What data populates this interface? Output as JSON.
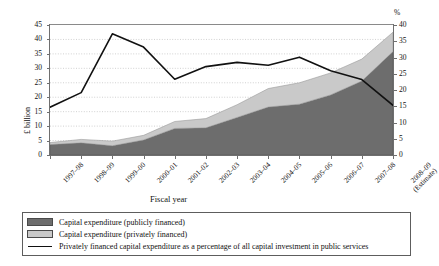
{
  "chart_data": {
    "type": "area",
    "title": "",
    "xlabel": "Fiscal year",
    "ylabel": "£ billion",
    "y2label": "%",
    "ylim": [
      0,
      45
    ],
    "y2lim": [
      0,
      40
    ],
    "yticks": [
      0,
      5,
      10,
      15,
      20,
      25,
      30,
      35,
      40,
      45
    ],
    "y2ticks": [
      0,
      5,
      10,
      15,
      20,
      25,
      30,
      35,
      40
    ],
    "grid": "horizontal-dotted",
    "legend_position": "bottom",
    "categories": [
      "1997–98",
      "1998–99",
      "1999–00",
      "2000–01",
      "2001–02",
      "2002–03",
      "2003–04",
      "2004–05",
      "2005–06",
      "2006–07",
      "2007–08",
      "2008–09"
    ],
    "category_sublabels": [
      "",
      "",
      "",
      "",
      "",
      "",
      "",
      "",
      "",
      "",
      "",
      "(Estimate)"
    ],
    "series": [
      {
        "name": "Capital expenditure (publicly financed)",
        "axis": "left",
        "units": "£ billion",
        "color": "#6d6d6d",
        "stacked": true,
        "values": [
          3.6,
          4.2,
          3.2,
          5.2,
          9.2,
          9.4,
          13.0,
          16.6,
          17.6,
          20.8,
          25.6,
          35.8
        ]
      },
      {
        "name": "Capital expenditure (privately financed)",
        "axis": "left",
        "units": "£ billion",
        "color": "#c9c9c9",
        "stacked": true,
        "values": [
          0.7,
          1.2,
          1.6,
          1.6,
          2.4,
          3.2,
          4.4,
          6.4,
          7.4,
          7.6,
          7.6,
          6.7
        ]
      },
      {
        "name": "Privately financed capital expenditure as a percentage of all capital investment in public services",
        "axis": "right",
        "units": "%",
        "color": "#111111",
        "type": "line",
        "values": [
          14.7,
          19.2,
          37.3,
          33.2,
          23.3,
          27.2,
          28.5,
          27.6,
          30.1,
          25.9,
          23.2,
          15.3
        ]
      }
    ],
    "left_axis_totals": [
      4.3,
      5.4,
      4.8,
      6.8,
      11.6,
      12.6,
      17.4,
      23.0,
      25.0,
      28.4,
      33.2,
      42.5
    ]
  },
  "legend": {
    "items": [
      {
        "marker": "dark-swatch",
        "label": "Capital expenditure (publicly financed)"
      },
      {
        "marker": "light-swatch",
        "label": "Capital expenditure (privately financed)"
      },
      {
        "marker": "line",
        "label": "Privately financed capital expenditure as a percentage of all capital investment in public services"
      }
    ]
  },
  "axes": {
    "y_title": "£ billion",
    "x_title": "Fiscal year",
    "percent_symbol": "%"
  },
  "colors": {
    "public": "#6d6d6d",
    "private": "#c9c9c9",
    "line": "#111111",
    "axis": "#6f6f6f",
    "grid": "#bdbdbd",
    "background": "#ffffff"
  }
}
